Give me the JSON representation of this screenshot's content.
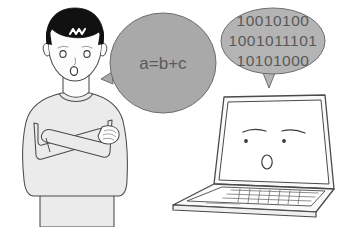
{
  "scene": {
    "title": "Person speaking algebraic expression to a laptop that replies in binary",
    "background_color": "#ffffff",
    "width": 348,
    "height": 227
  },
  "person": {
    "name": "confused-person",
    "hair_color": "#111111",
    "hair_highlight_color": "#ffffff",
    "skin_color": "#fdfdfd",
    "sweater_color": "#ebebeb",
    "outline_color": "#4a4a4a",
    "expression": "surprised",
    "pose": "arms-crossed"
  },
  "speech_bubble": {
    "name": "person-speech-bubble",
    "text": "a=b+c",
    "fill_color": "#a9a9a9",
    "text_color": "#5a5a5a",
    "outline_color": "#6e6e6e",
    "tail_direction": "left"
  },
  "binary_bubble": {
    "name": "laptop-speech-bubble",
    "lines": [
      "10010100",
      "1001011101",
      "10101000"
    ],
    "fill_color": "#b4b4b4",
    "text_color": "#5a5a5a",
    "outline_color": "#6e6e6e",
    "tail_direction": "down"
  },
  "laptop": {
    "name": "laptop-computer",
    "screen_color": "#ffffff",
    "body_color": "#fafafa",
    "outline_color": "#4a4a4a",
    "expression": "surprised",
    "face": {
      "eyes": 2,
      "eyebrows": 2,
      "mouth_shape": "oval"
    }
  }
}
